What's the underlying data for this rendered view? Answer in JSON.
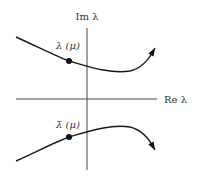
{
  "figure": {
    "axes": {
      "imaginary_label": "Im λ",
      "real_label": "Re λ"
    },
    "curves": [
      {
        "name": "lambda",
        "label": "λ (μ)",
        "path": "M16,37 C40,48 60,58 69,61 C90,67 110,74 130,71 C143,68 150,58 155,48",
        "dot": {
          "cx": 69,
          "cy": 61
        },
        "arrow": {
          "x": 155,
          "y": 48,
          "angle": -60
        }
      },
      {
        "name": "lambda-bar",
        "label": "λ̄ (μ)",
        "path": "M16,161 C40,150 60,140 69,137 C90,131 110,124 130,127 C143,130 150,140 155,150",
        "dot": {
          "cx": 69,
          "cy": 137
        },
        "arrow": {
          "x": 155,
          "y": 150,
          "angle": 60
        }
      }
    ],
    "colors": {
      "stroke": "#1a1a1a",
      "axis": "#444444",
      "text": "#333333",
      "background": "#ffffff"
    }
  }
}
